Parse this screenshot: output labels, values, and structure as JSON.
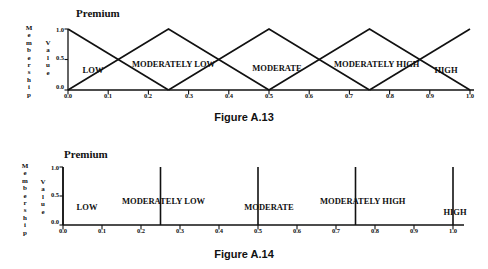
{
  "page": {
    "background_color": "#ffffff",
    "ink_color": "#111111"
  },
  "figures": [
    {
      "id": "figure-a13",
      "caption": "Figure A.13",
      "axis_title": "Premium",
      "y_axis_label_chars": [
        "M",
        "e",
        "m",
        "b",
        "e",
        "r",
        "s",
        "h",
        "i",
        "p"
      ],
      "y_axis_label_text": "Membership",
      "y_axis_label2_chars": [
        "V",
        "a",
        "l",
        "u",
        "e"
      ],
      "y_axis_label2_text": "Value",
      "chart_data": {
        "type": "line",
        "title": "Premium",
        "xlabel": "Premium",
        "ylabel": "Membership Value",
        "xlim": [
          0.0,
          1.0
        ],
        "ylim": [
          0.0,
          1.0
        ],
        "grid": false,
        "legend": "none",
        "xticks": [
          "0.0",
          "0.1",
          "0.2",
          "0.3",
          "0.4",
          "0.5",
          "0.6",
          "0.7",
          "0.8",
          "0.9",
          "1.0"
        ],
        "xtick_values": [
          0.0,
          0.1,
          0.2,
          0.3,
          0.4,
          0.5,
          0.6,
          0.7,
          0.8,
          0.9,
          1.0
        ],
        "yticks": [
          "0.0",
          "0.5",
          "1.0"
        ],
        "ytick_values": [
          0.0,
          0.5,
          1.0
        ],
        "series": [
          {
            "name": "LOW",
            "x": [
              0.0,
              0.25
            ],
            "values": [
              1.0,
              0.0
            ]
          },
          {
            "name": "MODERATELY LOW",
            "x": [
              0.0,
              0.25,
              0.5
            ],
            "values": [
              0.0,
              1.0,
              0.0
            ]
          },
          {
            "name": "MODERATE",
            "x": [
              0.25,
              0.5,
              0.75
            ],
            "values": [
              0.0,
              1.0,
              0.0
            ]
          },
          {
            "name": "MODERATELY HIGH",
            "x": [
              0.5,
              0.75,
              1.0
            ],
            "values": [
              0.0,
              1.0,
              0.0
            ]
          },
          {
            "name": "HIGH",
            "x": [
              0.75,
              1.0
            ],
            "values": [
              0.0,
              1.0
            ]
          }
        ],
        "annotations": [
          {
            "text": "LOW",
            "x": 0.08,
            "y": 0.28
          },
          {
            "text": "MODERATELY",
            "x": 0.315,
            "y": 0.38
          },
          {
            "text": "LOW",
            "x": 0.315,
            "y": 0.26
          },
          {
            "text": "MODERATE",
            "x": 0.585,
            "y": 0.3
          },
          {
            "text": "MODERATELY",
            "x": 0.8,
            "y": 0.37
          },
          {
            "text": "HIGH",
            "x": 0.8,
            "y": 0.25
          },
          {
            "text": "HIGH",
            "x": 0.955,
            "y": 0.27
          }
        ]
      },
      "set_labels": [
        {
          "line1": "LOW",
          "line2": ""
        },
        {
          "line1": "MODERATELY",
          "line2": "LOW"
        },
        {
          "line1": "MODERATE",
          "line2": ""
        },
        {
          "line1": "MODERATELY",
          "line2": "HIGH"
        },
        {
          "line1": "HIGH",
          "line2": ""
        }
      ]
    },
    {
      "id": "figure-a14",
      "caption": "Figure A.14",
      "axis_title": "Premium",
      "y_axis_label_chars": [
        "M",
        "e",
        "m",
        "b",
        "e",
        "r",
        "s",
        "h",
        "i",
        "p"
      ],
      "y_axis_label_text": "Membership",
      "y_axis_label2_chars": [
        "V",
        "a",
        "l",
        "u",
        "e"
      ],
      "y_axis_label2_text": "Value",
      "chart_data": {
        "type": "bar",
        "title": "Premium",
        "xlabel": "Premium",
        "ylabel": "Membership Value",
        "xlim": [
          0.0,
          1.0
        ],
        "ylim": [
          0.0,
          1.0
        ],
        "grid": false,
        "legend": "none",
        "xticks": [
          "0.0",
          "0.1",
          "0.2",
          "0.3",
          "0.4",
          "0.5",
          "0.6",
          "0.7",
          "0.8",
          "0.9",
          "1.0"
        ],
        "xtick_values": [
          0.0,
          0.1,
          0.2,
          0.3,
          0.4,
          0.5,
          0.6,
          0.7,
          0.8,
          0.9,
          1.0
        ],
        "yticks": [
          "0.0",
          "0.5",
          "1.0"
        ],
        "ytick_values": [
          0.0,
          0.5,
          1.0
        ],
        "categories": [
          "LOW",
          "MODERATELY LOW",
          "MODERATE",
          "MODERATELY HIGH",
          "HIGH"
        ],
        "x": [
          0.0,
          0.25,
          0.5,
          0.75,
          1.0
        ],
        "values": [
          1.0,
          1.0,
          1.0,
          1.0,
          1.0
        ],
        "annotations": [
          {
            "text": "LOW",
            "x": 0.035,
            "y": 0.3
          },
          {
            "text": "MODERATELY",
            "x": 0.275,
            "y": 0.38
          },
          {
            "text": "LOW",
            "x": 0.275,
            "y": 0.26
          },
          {
            "text": "MODERATE",
            "x": 0.555,
            "y": 0.3
          },
          {
            "text": "MODERATELY",
            "x": 0.805,
            "y": 0.38
          },
          {
            "text": "HIGH",
            "x": 0.805,
            "y": 0.26
          },
          {
            "text": "HIGH",
            "x": 0.975,
            "y": 0.22
          }
        ]
      },
      "set_labels": [
        {
          "line1": "LOW",
          "line2": ""
        },
        {
          "line1": "MODERATELY",
          "line2": "LOW"
        },
        {
          "line1": "MODERATE",
          "line2": ""
        },
        {
          "line1": "MODERATELY",
          "line2": "HIGH"
        },
        {
          "line1": "HIGH",
          "line2": ""
        }
      ]
    }
  ]
}
